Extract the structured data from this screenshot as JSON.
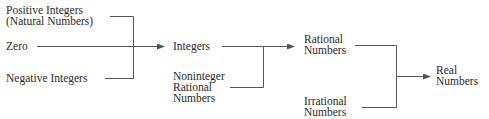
{
  "diagram": {
    "nodes": {
      "positive": {
        "line1": "Positive Integers",
        "line2": "(Natural Numbers)"
      },
      "zero": {
        "line1": "Zero"
      },
      "negative": {
        "line1": "Negative Integers"
      },
      "integers": {
        "line1": "Integers"
      },
      "noninteger": {
        "line1": "Noninteger",
        "line2": "Rational",
        "line3": "Numbers"
      },
      "rational": {
        "line1": "Rational",
        "line2": "Numbers"
      },
      "irrational": {
        "line1": "Irrational",
        "line2": "Numbers"
      },
      "real": {
        "line1": "Real",
        "line2": "Numbers"
      }
    },
    "edges": [
      {
        "from": [
          "positive",
          "zero",
          "negative"
        ],
        "to": "integers"
      },
      {
        "from": [
          "integers",
          "noninteger"
        ],
        "to": "rational"
      },
      {
        "from": [
          "rational",
          "irrational"
        ],
        "to": "real"
      }
    ],
    "line_color": "#555555"
  }
}
